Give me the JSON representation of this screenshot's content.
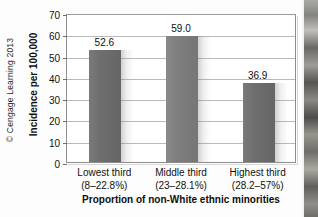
{
  "figure": {
    "copyright": "© Cengage Learning 2013"
  },
  "chart_data": {
    "type": "bar",
    "title": "",
    "xlabel": "Proportion of non-White ethnic minorities",
    "ylabel": "Incidence per 100,000",
    "categories": [
      "Lowest third",
      "Middle third",
      "Highest third"
    ],
    "category_sublabels": [
      "(8–22.8%)",
      "(23–28.1%)",
      "(28.2–57%)"
    ],
    "values": [
      52.6,
      59.0,
      36.9
    ],
    "value_labels": [
      "52.6",
      "59.0",
      "36.9"
    ],
    "ylim": [
      0,
      70
    ],
    "yticks": [
      0,
      10,
      20,
      30,
      40,
      50,
      60,
      70
    ],
    "ytick_labels": [
      "0",
      "10",
      "20",
      "30",
      "40",
      "50",
      "60",
      "70"
    ],
    "grid": true,
    "grid_axis": "y",
    "legend": false,
    "legend_position": "none",
    "bar_color": "#6b6b6b",
    "frame_color": "#8d8d8d",
    "grid_color": "#b9b9b9"
  }
}
